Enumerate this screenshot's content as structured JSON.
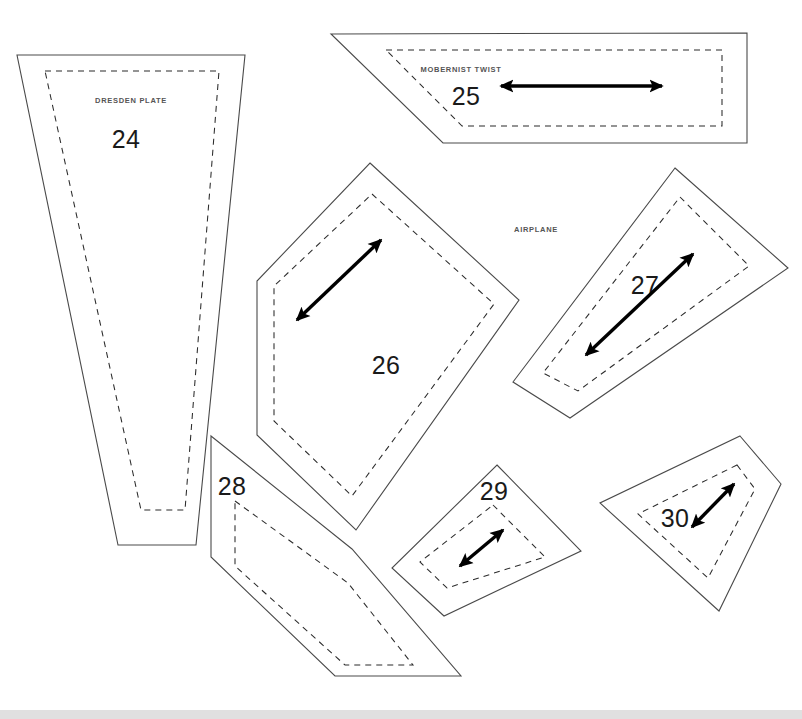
{
  "document": {
    "type": "sewing-pattern-sheet",
    "background_color": "#ffffff",
    "width": 802,
    "height": 719
  },
  "pieces": [
    {
      "id": "piece-24",
      "number": "24",
      "label": "DRESDEN PLATE",
      "number_pos": {
        "x": 126,
        "y": 148
      },
      "label_pos": {
        "x": 131,
        "y": 103
      },
      "has_grainline": false,
      "cutline": "17,55 245,55 196,545 118,545",
      "seamline": "45,71 219,71 185,510 141,510"
    },
    {
      "id": "piece-25",
      "number": "25",
      "label": "MOBERNIST TWIST",
      "number_pos": {
        "x": 466,
        "y": 105
      },
      "label_pos": {
        "x": 461,
        "y": 72
      },
      "has_grainline": true,
      "grainline": {
        "x1": 501,
        "y1": 86,
        "x2": 662,
        "y2": 86
      },
      "cutline": "331,34 747,33 747,143 443,143",
      "seamline": "386,50 722,50 722,126 462,126"
    },
    {
      "id": "piece-26",
      "number": "26",
      "label": "",
      "number_pos": {
        "x": 386,
        "y": 374
      },
      "has_grainline": true,
      "grainline": {
        "x1": 297,
        "y1": 320,
        "x2": 381,
        "y2": 240
      },
      "cutline": "370,163 519,300 356,530 257,435 257,281",
      "seamline": "372,194 494,304 352,496 274,421 274,286"
    },
    {
      "id": "piece-27",
      "number": "27",
      "label": "AIRPLANE",
      "number_pos": {
        "x": 645,
        "y": 294
      },
      "label_pos": {
        "x": 516,
        "y": 232
      },
      "has_grainline": true,
      "grainline": {
        "x1": 586,
        "y1": 355,
        "x2": 693,
        "y2": 254
      },
      "cutline": "675,168 788,268 570,418 513,382",
      "seamline": "680,197 749,266 578,391 543,373"
    },
    {
      "id": "piece-28",
      "number": "28",
      "label": "",
      "number_pos": {
        "x": 229,
        "y": 487
      },
      "has_grainline": false,
      "cutline": "211,436 352,549 461,676 335,676 211,557",
      "seamline": "235,501 348,583 413,665 345,665 235,566"
    },
    {
      "id": "piece-29",
      "number": "29",
      "label": "",
      "number_pos": {
        "x": 491,
        "y": 493
      },
      "has_grainline": true,
      "grainline": {
        "x1": 460,
        "y1": 566,
        "x2": 503,
        "y2": 530
      },
      "cutline": "497,465 581,551 444,616 392,568",
      "seamline": "493,505 545,557 447,588 420,562"
    },
    {
      "id": "piece-30",
      "number": "30",
      "label": "",
      "number_pos": {
        "x": 675,
        "y": 521
      },
      "has_grainline": true,
      "grainline": {
        "x1": 692,
        "y1": 527,
        "x2": 734,
        "y2": 484
      },
      "cutline": "740,436 781,484 719,611 600,503",
      "seamline": "737,465 755,489 708,578 638,514"
    }
  ],
  "legend": {
    "cutline_name": "cut-line-solid",
    "seamline_name": "seam-line-dashed",
    "grainline_name": "grain-line-arrow"
  },
  "colors": {
    "cutline": "#4a4a4a",
    "seamline": "#2b2b2b",
    "grainline": "#000000",
    "number_text": "#1a1a1a",
    "label_text": "#555555",
    "page": "#ffffff",
    "bottom_strip": "#e8e8e8"
  },
  "scrollbar": {
    "visible": true,
    "thumb_width_px": 802
  }
}
